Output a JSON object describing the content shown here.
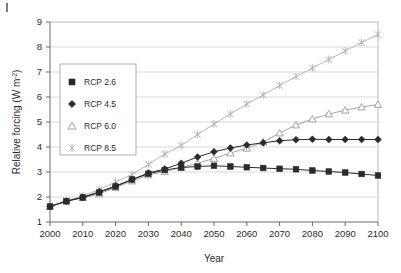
{
  "chart_data": {
    "type": "line",
    "title": "",
    "xlabel": "Year",
    "ylabel": "Relative forcing (W m-2)",
    "ylabel_main": "Relative forcing (W m",
    "ylabel_sup": "-2",
    "ylabel_tail": ")",
    "xlim": [
      2000,
      2100
    ],
    "ylim": [
      1,
      9
    ],
    "grid": "horizontal",
    "legend_position": "upper-left",
    "xticks": [
      "2000",
      "2010",
      "2020",
      "2030",
      "2040",
      "2050",
      "2060",
      "2070",
      "2080",
      "2090",
      "2100"
    ],
    "yticks": [
      "1",
      "2",
      "3",
      "4",
      "5",
      "6",
      "7",
      "8",
      "9"
    ],
    "x": [
      2000,
      2005,
      2010,
      2015,
      2020,
      2025,
      2030,
      2035,
      2040,
      2045,
      2050,
      2055,
      2060,
      2065,
      2070,
      2075,
      2080,
      2085,
      2090,
      2095,
      2100
    ],
    "series": [
      {
        "name": "RCP 2.6",
        "marker": "filled-square",
        "color": "#2b2b2b",
        "values": [
          1.62,
          1.83,
          1.98,
          2.18,
          2.42,
          2.7,
          2.93,
          3.08,
          3.18,
          3.22,
          3.25,
          3.22,
          3.19,
          3.16,
          3.13,
          3.11,
          3.06,
          3.02,
          2.98,
          2.92,
          2.86
        ]
      },
      {
        "name": "RCP 4.5",
        "marker": "filled-diamond",
        "color": "#2b2b2b",
        "values": [
          1.62,
          1.83,
          1.99,
          2.21,
          2.44,
          2.7,
          2.96,
          3.12,
          3.35,
          3.6,
          3.81,
          3.96,
          4.08,
          4.17,
          4.25,
          4.29,
          4.31,
          4.3,
          4.3,
          4.3,
          4.3
        ]
      },
      {
        "name": "RCP 6.0",
        "marker": "open-triangle",
        "color": "#9a9a9a",
        "values": [
          1.62,
          1.84,
          1.97,
          2.12,
          2.38,
          2.64,
          2.88,
          3.02,
          3.18,
          3.35,
          3.54,
          3.76,
          3.95,
          4.2,
          4.56,
          4.88,
          5.12,
          5.32,
          5.47,
          5.6,
          5.7
        ]
      },
      {
        "name": "RCP 8.5",
        "marker": "cross-x",
        "color": "#b0b0b0",
        "values": [
          1.63,
          1.86,
          2.04,
          2.3,
          2.6,
          2.9,
          3.3,
          3.72,
          4.06,
          4.5,
          4.92,
          5.32,
          5.72,
          6.08,
          6.46,
          6.82,
          7.16,
          7.5,
          7.84,
          8.18,
          8.5
        ]
      }
    ]
  },
  "legend": {
    "items": [
      {
        "label": "RCP 2.6"
      },
      {
        "label": "RCP 4.5"
      },
      {
        "label": "RCP 6.0"
      },
      {
        "label": "RCP 8.5"
      }
    ]
  },
  "colors": {
    "axis": "#6b6b6b",
    "grid": "#c9c9c9",
    "dark_series": "#2b2b2b",
    "mid_series": "#9a9a9a",
    "light_series": "#b0b0b0",
    "background": "#ffffff"
  }
}
